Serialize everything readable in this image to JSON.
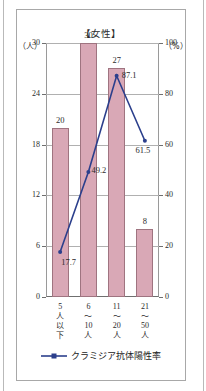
{
  "figure": {
    "title": "【女性】",
    "axis_left_unit": "（人）",
    "axis_right_unit": "（%）"
  },
  "legend": {
    "marker": "line-marker-icon",
    "label": "クラミジア抗体陽性率",
    "color": "#2b3f8c"
  },
  "colors": {
    "bar_fill": "#d9a8b6",
    "bar_edge": "#9f7480",
    "line": "#2b3f8c",
    "grid": "#b0b0b0",
    "axis": "#6f6f6f",
    "text": "#2b2b2b"
  },
  "chart_data": {
    "type": "bar",
    "title": "【女性】",
    "xlabel": "",
    "ylabel": "（人）",
    "y2label": "（%）",
    "grid": true,
    "legend_position": "bottom",
    "categories": [
      "5人以下",
      "6～10人",
      "11～20人",
      "21～50人"
    ],
    "category_lines": [
      [
        "5",
        "人",
        "以",
        "下"
      ],
      [
        "6",
        "～",
        "10",
        "人"
      ],
      [
        "11",
        "～",
        "20",
        "人"
      ],
      [
        "21",
        "～",
        "50",
        "人"
      ]
    ],
    "ylim": [
      0,
      30
    ],
    "yticks": [
      0,
      6,
      12,
      18,
      24,
      30
    ],
    "y2lim": [
      0,
      100
    ],
    "y2ticks": [
      0,
      20,
      40,
      60,
      80,
      100
    ],
    "series": [
      {
        "name": "人数",
        "type": "bar",
        "axis": "left",
        "values": [
          20,
          30,
          27,
          8
        ],
        "labels": [
          "20",
          "30",
          "27",
          "8"
        ]
      },
      {
        "name": "クラミジア抗体陽性率",
        "type": "line",
        "axis": "right",
        "values": [
          17.7,
          49.2,
          87.1,
          61.5
        ],
        "labels": [
          "17.7",
          "49.2",
          "87.1",
          "61.5"
        ]
      }
    ]
  }
}
